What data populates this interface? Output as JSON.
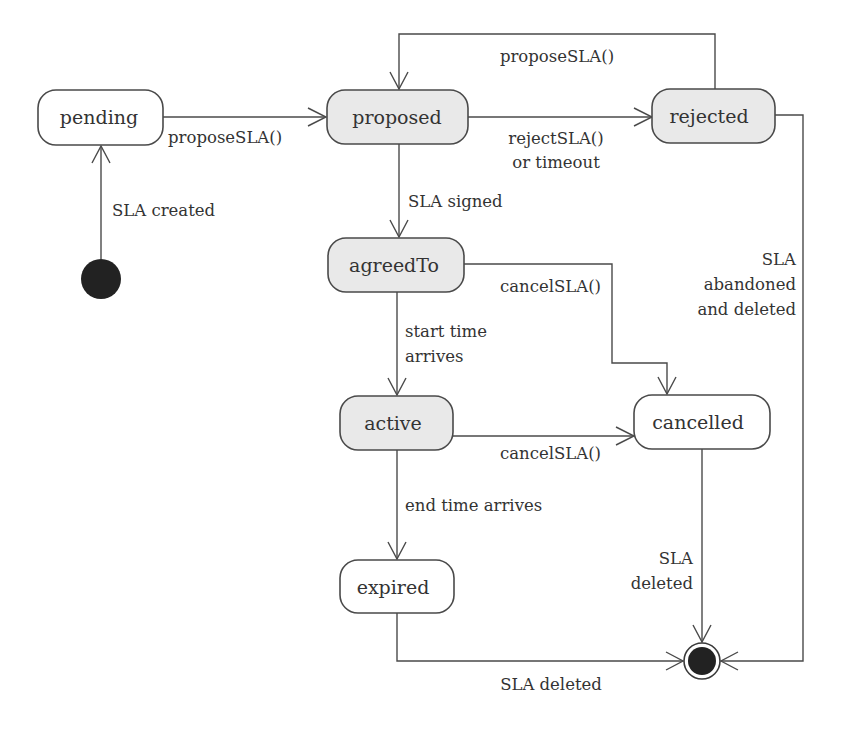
{
  "diagram": {
    "type": "UML state machine",
    "colors": {
      "stroke": "#4a4a4a",
      "shaded_fill": "#e9e9e9",
      "plain_fill": "#ffffff",
      "text": "#333333",
      "node_fill": "#222222"
    },
    "states": {
      "pending": {
        "label": "pending",
        "shaded": false
      },
      "proposed": {
        "label": "proposed",
        "shaded": true
      },
      "rejected": {
        "label": "rejected",
        "shaded": true
      },
      "agreedTo": {
        "label": "agreedTo",
        "shaded": true
      },
      "active": {
        "label": "active",
        "shaded": true
      },
      "cancelled": {
        "label": "cancelled",
        "shaded": false
      },
      "expired": {
        "label": "expired",
        "shaded": false
      }
    },
    "pseudostates": {
      "initial": {
        "kind": "initial-node"
      },
      "final": {
        "kind": "final-node"
      }
    },
    "transitions": {
      "created": {
        "from": "initial",
        "to": "pending",
        "label": "SLA created"
      },
      "propose1": {
        "from": "pending",
        "to": "proposed",
        "label": "proposeSLA()"
      },
      "reject": {
        "from": "proposed",
        "to": "rejected",
        "label_line1": "rejectSLA()",
        "label_line2": "or timeout"
      },
      "repropose": {
        "from": "rejected",
        "to": "proposed",
        "label": "proposeSLA()"
      },
      "signed": {
        "from": "proposed",
        "to": "agreedTo",
        "label": "SLA signed"
      },
      "abandoned": {
        "from": "rejected",
        "to": "final",
        "label_line1": "SLA",
        "label_line2": "abandoned",
        "label_line3": "and deleted"
      },
      "cancelAgreed": {
        "from": "agreedTo",
        "to": "cancelled",
        "label": "cancelSLA()"
      },
      "start": {
        "from": "agreedTo",
        "to": "active",
        "label_line1": "start time",
        "label_line2": "arrives"
      },
      "cancelActive": {
        "from": "active",
        "to": "cancelled",
        "label": "cancelSLA()"
      },
      "end": {
        "from": "active",
        "to": "expired",
        "label": "end time arrives"
      },
      "deleteCancelled": {
        "from": "cancelled",
        "to": "final",
        "label_line1": "SLA",
        "label_line2": "deleted"
      },
      "deleteExpired": {
        "from": "expired",
        "to": "final",
        "label": "SLA deleted"
      }
    }
  }
}
